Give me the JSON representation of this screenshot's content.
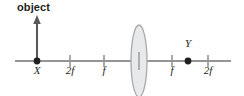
{
  "figure": {
    "title_label": "object",
    "background_color": "#ffffff",
    "axis_color": "#939598",
    "ink_color": "#231f20",
    "lens_stroke": "#a7a9ac",
    "lens_fill": "#e6e7e8",
    "axis": {
      "y": 61,
      "x_start": 15,
      "x_end": 231
    },
    "lens": {
      "center_x": 139,
      "center_y": 61,
      "half_width": 8,
      "half_height": 36,
      "name": "converging-lens"
    },
    "object_arrow": {
      "x": 37,
      "base_y": 61,
      "tip_y": 18
    },
    "points": [
      {
        "name": "X",
        "label": "X",
        "x": 37,
        "label_side": "below"
      },
      {
        "name": "Y",
        "label": "Y",
        "x": 188,
        "label_side": "above"
      }
    ],
    "ticks": [
      {
        "label": "2f",
        "x": 70
      },
      {
        "label": "f",
        "x": 104
      },
      {
        "label": "f",
        "x": 172
      },
      {
        "label": "2f",
        "x": 208
      }
    ]
  }
}
